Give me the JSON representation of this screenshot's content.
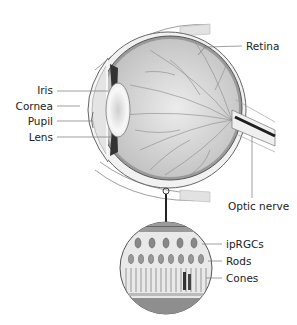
{
  "figure": {
    "labels": {
      "retina": "Retina",
      "iris": "Iris",
      "cornea": "Cornea",
      "pupil": "Pupil",
      "lens": "Lens",
      "optic_nerve": "Optic nerve",
      "iprgcs": "ipRGCs",
      "rods": "Rods",
      "cones": "Cones"
    },
    "colors": {
      "outline": "#555555",
      "sclera_fill": "#eeeeee",
      "vitreous_fill": "#d9d9d9",
      "vessels": "#8a8a8a",
      "nerve": "#222222",
      "label_line": "#777777"
    }
  }
}
